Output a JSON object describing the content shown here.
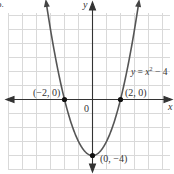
{
  "chart_data": {
    "type": "line",
    "title": "",
    "equation": "y = x² − 4",
    "equation_parts": {
      "prefix": "y = ",
      "var": "x",
      "exp": "2",
      "suffix": " − 4"
    },
    "xlabel": "x",
    "ylabel": "y",
    "origin_label": "0",
    "xlim": [
      -6.5,
      5.5
    ],
    "ylim": [
      -5,
      7
    ],
    "grid": true,
    "grid_step": 1,
    "function": "x^2 - 4",
    "x": [
      -3.3,
      -3,
      -2.5,
      -2,
      -1.5,
      -1,
      -0.5,
      0,
      0.5,
      1,
      1.5,
      2,
      2.5,
      3,
      3.3
    ],
    "y": [
      6.89,
      5,
      2.25,
      0,
      -1.75,
      -3,
      -3.75,
      -4,
      -3.75,
      -3,
      -1.75,
      0,
      2.25,
      5,
      6.89
    ],
    "points": [
      {
        "x": -2,
        "y": 0,
        "label": "(−2, 0)"
      },
      {
        "x": 2,
        "y": 0,
        "label": "(2, 0)"
      },
      {
        "x": 0,
        "y": -4,
        "label": "(0, −4)"
      }
    ],
    "colors": {
      "curve": "#555555",
      "axis": "#333333",
      "grid": "#d9d9d9",
      "point": "#111111"
    }
  },
  "corner_fragment": "b."
}
